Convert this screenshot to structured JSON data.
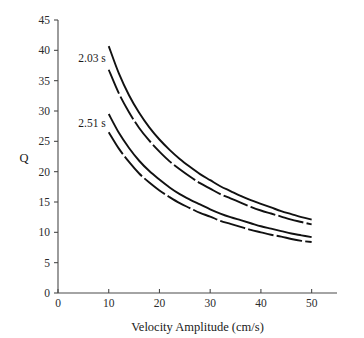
{
  "chart_data": {
    "type": "line",
    "title": "",
    "xlabel": "Velocity Amplitude (cm/s)",
    "ylabel": "Q",
    "xlim": [
      0,
      55
    ],
    "ylim": [
      0,
      45
    ],
    "xticks": [
      0,
      10,
      20,
      30,
      40,
      50
    ],
    "yticks": [
      0,
      5,
      10,
      15,
      20,
      25,
      30,
      35,
      40,
      45
    ],
    "xtick_labels": [
      "0",
      "10",
      "20",
      "30",
      "40",
      "50"
    ],
    "ytick_labels": [
      "0",
      "5",
      "10",
      "15",
      "20",
      "25",
      "30",
      "35",
      "40",
      "45"
    ],
    "grid": false,
    "legend_position": "inline-annotation",
    "annotations": [
      {
        "text": "2.03 s",
        "x": 4.0,
        "y": 38.0
      },
      {
        "text": "2.51 s",
        "x": 4.0,
        "y": 27.3
      }
    ],
    "x": [
      10,
      12,
      14,
      16,
      18,
      20,
      22,
      24,
      26,
      28,
      30,
      32,
      34,
      36,
      38,
      40,
      42,
      44,
      46,
      48,
      50
    ],
    "series": [
      {
        "name": "2.03 s upper",
        "style": "solid",
        "values": [
          40.7,
          36.2,
          32.6,
          29.7,
          27.3,
          25.3,
          23.6,
          22.1,
          20.8,
          19.6,
          18.6,
          17.6,
          16.8,
          16.0,
          15.3,
          14.7,
          14.1,
          13.5,
          13.0,
          12.5,
          12.1
        ]
      },
      {
        "name": "2.03 s lower",
        "style": "broken",
        "values": [
          36.8,
          32.9,
          29.8,
          27.2,
          25.1,
          23.3,
          21.7,
          20.4,
          19.2,
          18.1,
          17.2,
          16.3,
          15.6,
          14.9,
          14.2,
          13.6,
          13.1,
          12.6,
          12.1,
          11.7,
          11.3
        ]
      },
      {
        "name": "2.51 s upper",
        "style": "solid",
        "values": [
          29.5,
          26.4,
          23.9,
          21.8,
          20.1,
          18.7,
          17.4,
          16.3,
          15.4,
          14.6,
          13.8,
          13.1,
          12.5,
          12.0,
          11.5,
          11.0,
          10.6,
          10.2,
          9.8,
          9.5,
          9.2
        ]
      },
      {
        "name": "2.51 s lower",
        "style": "broken",
        "values": [
          26.5,
          23.8,
          21.6,
          19.7,
          18.2,
          16.9,
          15.8,
          14.8,
          14.0,
          13.2,
          12.6,
          11.9,
          11.4,
          10.9,
          10.4,
          10.0,
          9.6,
          9.3,
          8.9,
          8.6,
          8.4
        ]
      }
    ]
  }
}
